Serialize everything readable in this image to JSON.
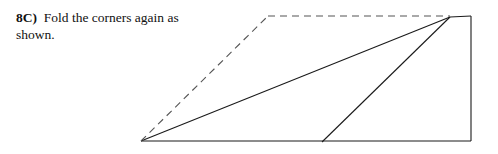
{
  "caption": {
    "step_label": "8C)",
    "step_text": "Fold the corners again as shown."
  },
  "figure": {
    "solid_color": "#1a1a1a",
    "dashed_color": "#555555",
    "background_color": "#ffffff",
    "solid_stroke_width": 1.1,
    "dashed_stroke_width": 1.1,
    "dash_pattern": "7,5",
    "vertices": {
      "bottom_left": [
        141,
        141
      ],
      "bottom_mid": [
        322,
        142
      ],
      "bottom_right": [
        471,
        141
      ],
      "top_right": [
        471,
        16
      ],
      "apex": [
        450,
        17
      ],
      "dashed_apex": [
        268,
        16
      ]
    },
    "edges": [
      {
        "name": "bottom-edge",
        "style": "solid",
        "from": [
          141,
          141
        ],
        "to": [
          471,
          141
        ]
      },
      {
        "name": "right-edge",
        "style": "solid",
        "from": [
          471,
          141
        ],
        "to": [
          471,
          16
        ]
      },
      {
        "name": "top-edge-segment",
        "style": "solid",
        "from": [
          471,
          16
        ],
        "to": [
          450,
          17
        ]
      },
      {
        "name": "long-fold-line",
        "style": "solid",
        "from": [
          141,
          141
        ],
        "to": [
          450,
          17
        ]
      },
      {
        "name": "short-fold-line",
        "style": "solid",
        "from": [
          322,
          142
        ],
        "to": [
          450,
          17
        ]
      },
      {
        "name": "dashed-diagonal-guide",
        "style": "dashed",
        "from": [
          141,
          141
        ],
        "to": [
          268,
          16
        ]
      },
      {
        "name": "dashed-horizontal-guide",
        "style": "dashed",
        "from": [
          268,
          16
        ],
        "to": [
          450,
          16
        ]
      }
    ]
  }
}
